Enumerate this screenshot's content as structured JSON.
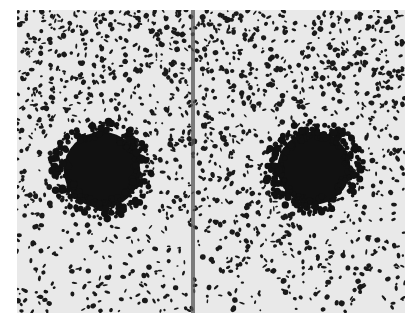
{
  "image": {
    "description": "Grayscale speckle photograph with two dark circular blobs separated by a vertical line",
    "frame": {
      "x": 17,
      "y": 10,
      "width": 388,
      "height": 303
    },
    "colors": {
      "background": "#e9e9e9",
      "speckle": "#1a1a1a",
      "blob": "#111111",
      "divider": "#555555"
    },
    "blobs": [
      {
        "cx": 85,
        "cy": 160,
        "r": 45
      },
      {
        "cx": 297,
        "cy": 158,
        "r": 43
      }
    ],
    "divider": {
      "x": 174,
      "width": 4
    },
    "speckle_count": 2600,
    "seed": 7
  }
}
